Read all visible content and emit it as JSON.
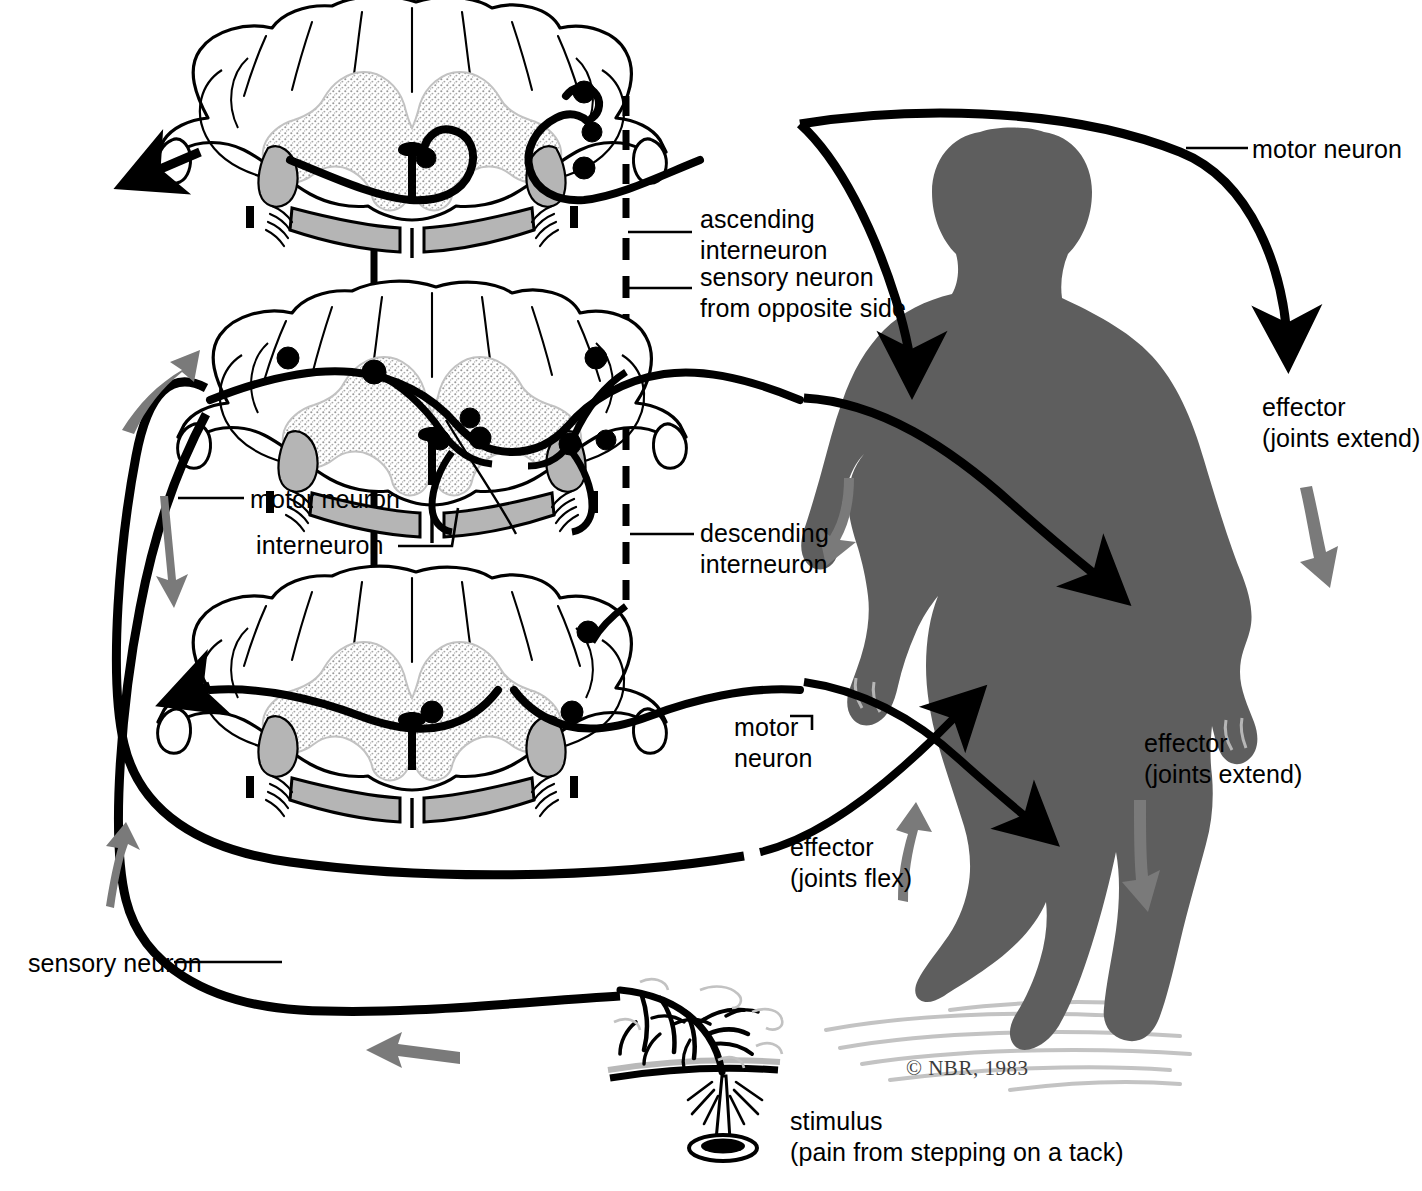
{
  "figure": {
    "copyright": "© NBR, 1983",
    "colors": {
      "ink": "#000000",
      "body_silhouette": "#5e5e5e",
      "flow_arrow": "#7a7a7a",
      "gray_matter_stipple": "#d9d9d9",
      "funiculus_gray": "#b5b5b5",
      "background": "#ffffff",
      "ground_shadow": "#b9b9b9"
    }
  },
  "labels": {
    "ascending_interneuron": "ascending\ninterneuron",
    "sensory_neuron_opposite": "sensory neuron\nfrom opposite side",
    "motor_neuron_top_right": "motor neuron",
    "effector_extend_upper": "effector\n(joints extend)",
    "motor_neuron_left": "motor neuron",
    "interneuron": "interneuron",
    "descending_interneuron": "descending\ninterneuron",
    "motor_neuron_mid": "motor\nneuron",
    "effector_flex": "effector\n(joints flex)",
    "effector_extend_lower": "effector\n(joints extend)",
    "sensory_neuron": "sensory neuron",
    "stimulus": "stimulus\n(pain from stepping on a tack)"
  },
  "structures": {
    "cord_sections": [
      {
        "name": "spinal-cord-section-upper",
        "level": "upper"
      },
      {
        "name": "spinal-cord-section-middle",
        "level": "middle"
      },
      {
        "name": "spinal-cord-section-lower",
        "level": "lower"
      }
    ],
    "pathways": [
      "sensory-neuron-pathway",
      "ascending-interneuron-pathway",
      "descending-interneuron-pathway",
      "interneuron-pathway",
      "motor-neuron-pathway"
    ],
    "flow_arrows": [
      {
        "name": "flow-arrow-up-left",
        "direction": "up"
      },
      {
        "name": "flow-arrow-down-left",
        "direction": "down"
      },
      {
        "name": "flow-arrow-up-lower-left",
        "direction": "up"
      },
      {
        "name": "flow-arrow-left-bottom",
        "direction": "left"
      },
      {
        "name": "flow-arrow-torso-down",
        "direction": "down"
      },
      {
        "name": "flow-arrow-arm-down",
        "direction": "down"
      },
      {
        "name": "flow-arrow-leg-up",
        "direction": "up"
      },
      {
        "name": "flow-arrow-leg-down",
        "direction": "down"
      }
    ],
    "human_figure": "human-body-silhouette",
    "stimulus_object": "tack"
  }
}
